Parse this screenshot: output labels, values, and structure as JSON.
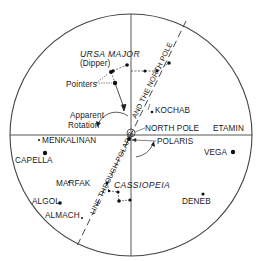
{
  "diagram": {
    "colors": {
      "ink": "#1a1a1a",
      "line": "#444444",
      "background": "#ffffff"
    },
    "circle": {
      "cx": 131,
      "cy": 135,
      "r": 121
    },
    "axes": {
      "horizontal_y": 135,
      "vertical_x": 131
    },
    "pole_marker": {
      "cx": 131,
      "cy": 133,
      "r": 4
    },
    "dashed_line": {
      "x1": 186,
      "y1": 21,
      "x2": 77,
      "y2": 246
    },
    "labels": {
      "ursa_major": "URSA MAJOR",
      "dipper": "(Dipper)",
      "pointers": "Pointers",
      "apparent": "Apparent",
      "rotation": "Rotation",
      "kochab": "KOCHAB",
      "north_pole": "NORTH POLE",
      "etamin": "ETAMIN",
      "polaris": "POLARIS",
      "menkalinan": "MENKALINAN",
      "capella": "CAPELLA",
      "vega": "VEGA",
      "marfak": "MARFAK",
      "cassiopeia": "CASSIOPEIA",
      "algol": "ALGOL",
      "almach": "ALMACH",
      "deneb": "DENEB",
      "line_upper": "AND THE NORTH POLE",
      "line_lower": "LINE THROUGH POLARIS"
    },
    "stars": [
      {
        "name": "ursa-major-1",
        "x": 127,
        "y": 65,
        "r": 1.8
      },
      {
        "name": "ursa-major-2",
        "x": 113,
        "y": 71,
        "r": 1.8
      },
      {
        "name": "pointer-top",
        "x": 111,
        "y": 72,
        "r": 2
      },
      {
        "name": "pointer-bottom",
        "x": 115,
        "y": 83,
        "r": 2.2
      },
      {
        "name": "ursa-major-handle-1",
        "x": 145,
        "y": 71,
        "r": 1.6
      },
      {
        "name": "ursa-major-handle-2",
        "x": 157,
        "y": 71,
        "r": 1.6
      },
      {
        "name": "ursa-major-handle-3",
        "x": 169,
        "y": 63,
        "r": 1.8
      },
      {
        "name": "kochab",
        "x": 152,
        "y": 112,
        "r": 1.3
      },
      {
        "name": "polaris",
        "x": 129,
        "y": 139,
        "r": 2
      },
      {
        "name": "menkalinan",
        "x": 39,
        "y": 140,
        "r": 1
      },
      {
        "name": "capella",
        "x": 45,
        "y": 153,
        "r": 2.2
      },
      {
        "name": "vega",
        "x": 233,
        "y": 152,
        "r": 2.2
      },
      {
        "name": "marfak",
        "x": 69,
        "y": 182,
        "r": 1
      },
      {
        "name": "algol",
        "x": 60,
        "y": 203,
        "r": 1.8
      },
      {
        "name": "almach",
        "x": 82,
        "y": 218,
        "r": 1
      },
      {
        "name": "deneb",
        "x": 203,
        "y": 194,
        "r": 1.6
      },
      {
        "name": "cassiopeia-1",
        "x": 107,
        "y": 183,
        "r": 1.4
      },
      {
        "name": "cassiopeia-2",
        "x": 109,
        "y": 191,
        "r": 1.2
      },
      {
        "name": "cassiopeia-3",
        "x": 118,
        "y": 192,
        "r": 1.6
      },
      {
        "name": "cassiopeia-4",
        "x": 119,
        "y": 201,
        "r": 1.8
      },
      {
        "name": "cassiopeia-5",
        "x": 130,
        "y": 200,
        "r": 1.6
      }
    ]
  }
}
